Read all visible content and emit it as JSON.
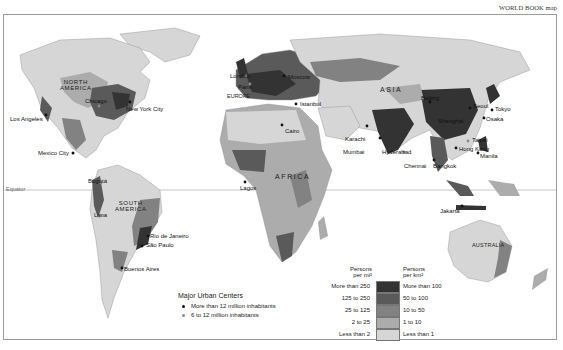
{
  "credit": "WORLD BOOK map",
  "colors": {
    "level_1": "#333333",
    "level_2": "#5a5a5a",
    "level_3": "#828282",
    "level_4": "#acacac",
    "level_5": "#d6d6d6",
    "frame": "#9a9a9a",
    "equator_line": "#b5b5b5"
  },
  "continents": {
    "north_america": "NORTH\nAMERICA",
    "south_america": "SOUTH\nAMERICA",
    "europe": "EUROPE",
    "asia": "ASIA",
    "africa": "AFRICA",
    "australia": "AUSTRALIA"
  },
  "equator_label": "Equator",
  "cities": {
    "los_angeles": "Los Angeles",
    "chicago": "Chicago",
    "new_york": "New York City",
    "mexico_city": "Mexico City",
    "bogota": "Bogotá",
    "lima": "Lima",
    "rio": "Rio de Janeiro",
    "sao_paulo": "São Paulo",
    "buenos_aires": "Buenos Aires",
    "london": "London",
    "paris": "Paris",
    "moscow": "Moscow",
    "istanbul": "Istanbul",
    "cairo": "Cairo",
    "lagos": "Lagos",
    "karachi": "Karachi",
    "mumbai": "Mumbai",
    "hyderabad": "Hyderabad",
    "chennai": "Chennai",
    "beijing": "Beijing",
    "seoul": "Seoul",
    "tokyo": "Tokyo",
    "osaka": "Osaka",
    "shanghai": "Shanghai",
    "taipei": "Taipei",
    "hong_kong": "Hong Kong",
    "manila": "Manila",
    "bangkok": "Bangkok",
    "jakarta": "Jakarta"
  },
  "urban_legend": {
    "title": "Major Urban Centers",
    "items": [
      {
        "label": "More than 12 million inhabitants",
        "color": "#111111"
      },
      {
        "label": "6 to 12 million inhabitants",
        "color": "#8a8a8a"
      }
    ]
  },
  "density_legend": {
    "header_mi": "Persons\nper mi²",
    "header_km": "Persons\nper km²",
    "rows": [
      {
        "per_mi": "More than 250",
        "per_km": "More than 100",
        "color": "#333333"
      },
      {
        "per_mi": "125 to 250",
        "per_km": "50 to 100",
        "color": "#5a5a5a"
      },
      {
        "per_mi": "25 to 125",
        "per_km": "10 to 50",
        "color": "#828282"
      },
      {
        "per_mi": "2 to 25",
        "per_km": "1 to 10",
        "color": "#acacac"
      },
      {
        "per_mi": "Less than 2",
        "per_km": "Less than 1",
        "color": "#d6d6d6"
      }
    ]
  }
}
